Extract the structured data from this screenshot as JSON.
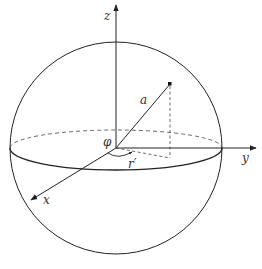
{
  "diagram": {
    "type": "sphere-coordinate-system",
    "colors": {
      "stroke": "#222222",
      "background": "#ffffff"
    },
    "axes": {
      "z": {
        "label": "z"
      },
      "y": {
        "label": "y"
      },
      "x": {
        "label": "x"
      }
    },
    "labels": {
      "radius": "a",
      "angle": "φ",
      "projection": "r′"
    }
  }
}
